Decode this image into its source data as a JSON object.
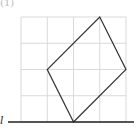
{
  "figure": {
    "label": "(1)",
    "line_label": "l",
    "grid": {
      "cols": 4,
      "rows": 4,
      "origin_px": [
        21,
        122
      ],
      "cell_px": 26.25,
      "color": "#d9d9d9"
    },
    "shape": {
      "type": "quadrilateral",
      "vertices_grid": [
        [
          2,
          0
        ],
        [
          4,
          2
        ],
        [
          3,
          4
        ],
        [
          1,
          2
        ]
      ],
      "stroke": "#333333"
    },
    "baseline": {
      "y_grid": 0,
      "x_from_px": 8,
      "x_to_px": 134,
      "stroke": "#222222"
    }
  }
}
